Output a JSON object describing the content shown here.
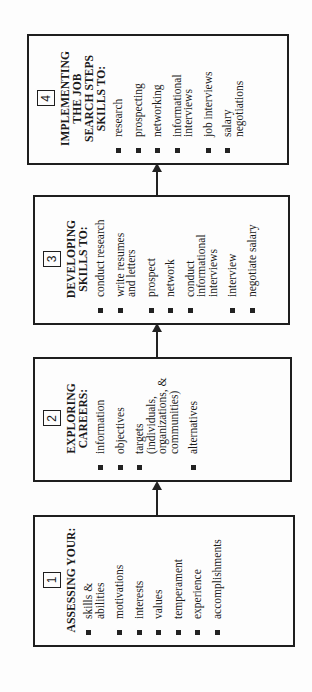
{
  "diagram": {
    "orientation": "rotated 90° counter-clockwise",
    "steps": [
      {
        "number": "1",
        "title": "ASSESSING YOUR:",
        "items": [
          "skills &\nabilities",
          "motivations",
          "interests",
          "values",
          "temperament",
          "experience",
          "accomplishments"
        ]
      },
      {
        "number": "2",
        "title": "EXPLORING\nCAREERS:",
        "items": [
          "information",
          "objectives",
          "targets\n(individuals,\norganizations, &\ncommunities)",
          "alternatives"
        ]
      },
      {
        "number": "3",
        "title": "DEVELOPING\nSKILLS TO:",
        "items": [
          "conduct research",
          "write resumes\nand letters",
          "prospect",
          "network",
          "conduct\ninformational\ninterviews",
          "interview",
          "negotiate salary"
        ]
      },
      {
        "number": "4",
        "title": "IMPLEMENTING\nTHE JOB\nSEARCH STEPS\nSKILLS TO:",
        "items": [
          "research",
          "prospecting",
          "networking",
          "informational\ninterviews",
          "job interviews",
          "salary\nnegotiations"
        ]
      }
    ],
    "arrows": [
      "step1-to-step2",
      "step2-to-step3",
      "step3-to-step4"
    ],
    "colors": {
      "line": "#1e1e1e",
      "background": "#fdfdfd"
    }
  }
}
